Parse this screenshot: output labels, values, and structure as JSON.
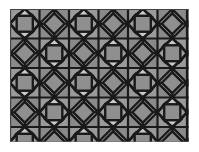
{
  "figure": {
    "title": "Snub square geometric tiling pattern",
    "width": 199,
    "height": 152
  },
  "canvas": {
    "background_color": "#ffffff",
    "plot_left": 10,
    "plot_top": 9,
    "plot_width": 179,
    "plot_height": 133
  },
  "palette": {
    "background": "#ffffff",
    "field": "#9a9a9a",
    "square_fill": "#8f8f8f",
    "triangle_light": "#c9c9c9",
    "triangle_mid": "#9d9d9d",
    "triangle_dark": "#8a8a8a",
    "outline": "#1a1a1a",
    "edge_shadow": "#6f6f6f"
  },
  "pattern": {
    "name": "snub-square-tiling",
    "tile_size": 29.5,
    "stroke_width": 2.2,
    "columns": 7,
    "rows": 5,
    "origin_x": 10,
    "origin_y": 9,
    "square_inset": 0.27,
    "motifs": [
      {
        "shape": "square-axis-aligned",
        "fill_key": "square_fill"
      },
      {
        "shape": "square-rotated-45",
        "fill_key": "square_fill"
      },
      {
        "shape": "triangle-light",
        "fill_key": "triangle_light"
      },
      {
        "shape": "triangle-mid",
        "fill_key": "triangle_mid"
      }
    ]
  }
}
